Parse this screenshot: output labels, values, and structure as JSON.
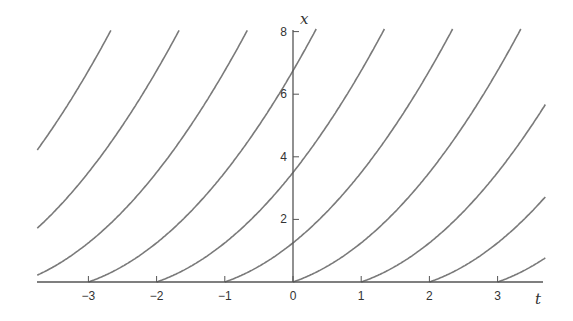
{
  "chart_data": {
    "type": "line",
    "title": "",
    "xlabel": "t",
    "ylabel": "x",
    "xlim": [
      -3.75,
      3.7
    ],
    "ylim": [
      0,
      8
    ],
    "grid": false,
    "legend": null,
    "x_ticks": [
      -3,
      -2,
      -1,
      0,
      1,
      2,
      3
    ],
    "x_tick_labels": [
      "−3",
      "−2",
      "−1",
      "0",
      "1",
      "2",
      "3"
    ],
    "y_ticks": [
      2,
      4,
      6,
      8
    ],
    "y_tick_labels": [
      "2",
      "4",
      "6",
      "8"
    ],
    "series": [
      {
        "name": "c=-6",
        "start_t": -6,
        "points": [
          [
            -3.75,
            4.22
          ],
          [
            -3.0,
            6.75
          ],
          [
            -2.7,
            8.0
          ]
        ]
      },
      {
        "name": "c=-5",
        "start_t": -5,
        "points": [
          [
            -3.75,
            1.72
          ],
          [
            -3.0,
            3.5
          ],
          [
            -2.0,
            6.75
          ],
          [
            -1.7,
            8.0
          ]
        ]
      },
      {
        "name": "c=-4",
        "start_t": -4,
        "points": [
          [
            -3.75,
            0.22
          ],
          [
            -3.0,
            1.25
          ],
          [
            -2.0,
            3.5
          ],
          [
            -1.0,
            6.75
          ],
          [
            -0.7,
            8.0
          ]
        ]
      },
      {
        "name": "c=-3",
        "start_t": -3,
        "points": [
          [
            -3,
            0
          ],
          [
            -2,
            1.25
          ],
          [
            -1,
            3.5
          ],
          [
            0,
            6.75
          ],
          [
            0.3,
            8.0
          ]
        ]
      },
      {
        "name": "c=-2",
        "start_t": -2,
        "points": [
          [
            -2,
            0
          ],
          [
            -1,
            1.25
          ],
          [
            0,
            3.5
          ],
          [
            1,
            6.75
          ],
          [
            1.3,
            8.0
          ]
        ]
      },
      {
        "name": "c=-1",
        "start_t": -1,
        "points": [
          [
            -1,
            0
          ],
          [
            0,
            1.25
          ],
          [
            1,
            3.5
          ],
          [
            2,
            6.75
          ],
          [
            2.3,
            8.0
          ]
        ]
      },
      {
        "name": "c=0",
        "start_t": 0,
        "points": [
          [
            0,
            0
          ],
          [
            1,
            1.25
          ],
          [
            2,
            3.5
          ],
          [
            3,
            6.75
          ],
          [
            3.3,
            8.0
          ]
        ]
      },
      {
        "name": "c=1",
        "start_t": 1,
        "points": [
          [
            1,
            0
          ],
          [
            2,
            1.25
          ],
          [
            3,
            3.5
          ],
          [
            3.7,
            5.7
          ]
        ]
      },
      {
        "name": "c=2",
        "start_t": 2,
        "points": [
          [
            2,
            0
          ],
          [
            3,
            1.25
          ],
          [
            3.7,
            2.72
          ]
        ]
      },
      {
        "name": "c=3",
        "start_t": 3,
        "points": [
          [
            3,
            0
          ],
          [
            3.7,
            0.77
          ]
        ]
      }
    ],
    "line_color": "#7a7a7a",
    "axis_color": "#555555"
  }
}
